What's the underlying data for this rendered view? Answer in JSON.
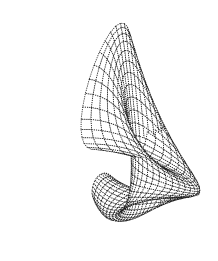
{
  "figure": {
    "title": "",
    "caption": "",
    "background_color": "#ffffff",
    "width": 218,
    "height": 261
  },
  "chart_data": {
    "type": "surface-wireframe",
    "title": "",
    "subtitle": "",
    "xlabel": "",
    "ylabel": "",
    "zlabel": "",
    "grid": false,
    "axes_visible": false,
    "legend": null,
    "legend_position": "none",
    "render_style": "dotted-mesh",
    "line_color": "#1a1a1a",
    "line_width": 0.85,
    "dash_pattern": [
      1.1,
      1.1
    ],
    "face_color": "#ffffff",
    "hidden_line_removal": true,
    "surface": {
      "name": "folded-horn-shell",
      "u_label": "u",
      "v_label": "v",
      "u_range": [
        0,
        6.283185307179586
      ],
      "v_range": [
        0,
        6.283185307179586
      ],
      "u_samples": 30,
      "v_samples": 34,
      "parameters": {
        "R_major": 1.0,
        "r_minor": 0.62,
        "taper": 0.58,
        "fold_twist": 1.0,
        "flare": 0.42
      }
    },
    "view": {
      "azimuth_deg": -38,
      "elevation_deg": 22,
      "roll_deg": -8,
      "projection": "perspective",
      "distance": 7.4,
      "zoom": 1.0,
      "center_x": 105,
      "center_y": 133,
      "scale": 70
    },
    "xlim": [
      -1.7,
      1.7
    ],
    "ylim": [
      -1.7,
      1.7
    ],
    "zlim": [
      -1.7,
      1.7
    ],
    "bounding_box_px": {
      "left": 18,
      "top": 22,
      "right": 206,
      "bottom": 246
    }
  }
}
